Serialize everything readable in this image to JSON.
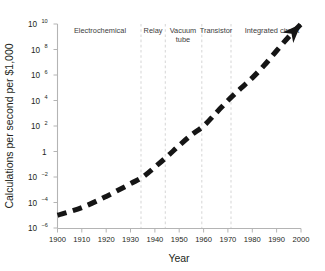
{
  "chart_data": {
    "type": "line",
    "title": "",
    "subtitle": "",
    "xlabel": "Year",
    "ylabel": "Calculations per second per $1,000",
    "xlim": [
      1900,
      2000
    ],
    "ylim": [
      1e-06,
      10000000000.0
    ],
    "yscale": "log",
    "xscale": "linear",
    "grid": false,
    "legend": "none",
    "xticks": [
      "1900",
      "1910",
      "1920",
      "1930",
      "1940",
      "1950",
      "1960",
      "1970",
      "1980",
      "1990",
      "2000"
    ],
    "xtick_values": [
      1900,
      1910,
      1920,
      1930,
      1940,
      1950,
      1960,
      1970,
      1980,
      1990,
      2000
    ],
    "yticks": [
      {
        "base": "10",
        "exp": "10",
        "value": 10000000000.0
      },
      {
        "base": "10",
        "exp": "8",
        "value": 100000000.0
      },
      {
        "base": "10",
        "exp": "6",
        "value": 1000000.0
      },
      {
        "base": "10",
        "exp": "4",
        "value": 10000.0
      },
      {
        "base": "10",
        "exp": "2",
        "value": 100
      },
      {
        "base": "1",
        "exp": "",
        "value": 1
      },
      {
        "base": "10",
        "exp": "−2",
        "value": 0.01
      },
      {
        "base": "10",
        "exp": "−4",
        "value": 0.0001
      },
      {
        "base": "10",
        "exp": "−6",
        "value": 1e-06
      }
    ],
    "series": [
      {
        "name": "Computing power per $1,000",
        "style": "dashed-thick-black-with-arrow",
        "x": [
          1900,
          1910,
          1920,
          1930,
          1935,
          1940,
          1945,
          1950,
          1955,
          1960,
          1965,
          1970,
          1975,
          1980,
          1985,
          1990,
          1995,
          2000
        ],
        "y": [
          1e-05,
          4e-05,
          0.0003,
          0.003,
          0.01,
          0.06,
          0.4,
          3.0,
          20,
          100,
          1000.0,
          10000.0,
          80000.0,
          600000.0,
          6000000.0,
          80000000.0,
          1000000000.0,
          10000000000.0
        ]
      }
    ],
    "annotations": [
      {
        "name": "era-electrochemical",
        "label": "Electrochemical",
        "x_center": 1917,
        "span": [
          1900,
          1935
        ]
      },
      {
        "name": "era-relay",
        "label": "Relay",
        "x_center": 1940,
        "span": [
          1935,
          1945
        ]
      },
      {
        "name": "era-vacuum-tube",
        "label": "Vacuum tube",
        "line1": "Vacuum",
        "line2": "tube",
        "x_center": 1952,
        "span": [
          1945,
          1960
        ]
      },
      {
        "name": "era-transistor",
        "label": "Transistor",
        "x_center": 1966,
        "span": [
          1960,
          1972
        ]
      },
      {
        "name": "era-integrated-circuit",
        "label": "Integrated circuit",
        "x_center": 1987,
        "span": [
          1972,
          2000
        ]
      }
    ],
    "era_dividers": [
      1935,
      1945,
      1960,
      1972
    ],
    "colors": {
      "curve": "#151515",
      "axis": "#b4b4b4",
      "divider": "#d9d9d9",
      "text": "#231f20",
      "era_text": "#3c3c3c",
      "background": "#ffffff"
    }
  },
  "axes": {
    "y_title": "Calculations per second per $1,000",
    "x_title": "Year"
  },
  "eras": {
    "electrochemical": "Electrochemical",
    "relay": "Relay",
    "vacuum_tube_line1": "Vacuum",
    "vacuum_tube_line2": "tube",
    "transistor": "Transistor",
    "integrated_circuit": "Integrated circuit"
  },
  "ytick_text": {
    "t0_base": "10",
    "t0_exp": "10",
    "t1_base": "10",
    "t1_exp": "8",
    "t2_base": "10",
    "t2_exp": "6",
    "t3_base": "10",
    "t3_exp": "4",
    "t4_base": "10",
    "t4_exp": "2",
    "t5_base": "1",
    "t5_exp": "",
    "t6_base": "10",
    "t6_exp": "−2",
    "t7_base": "10",
    "t7_exp": "−4",
    "t8_base": "10",
    "t8_exp": "−6"
  },
  "xtick_text": {
    "x0": "1900",
    "x1": "1910",
    "x2": "1920",
    "x3": "1930",
    "x4": "1940",
    "x5": "1950",
    "x6": "1960",
    "x7": "1970",
    "x8": "1980",
    "x9": "1990",
    "x10": "2000"
  }
}
